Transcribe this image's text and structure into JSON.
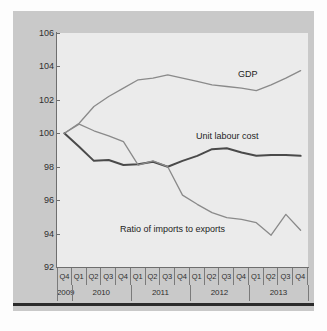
{
  "figure": {
    "background_color": "#c9c9c9",
    "plot_background_color": "#ebebeb",
    "rule_color": "#2b2b2b"
  },
  "chart_data": {
    "type": "line",
    "title": "",
    "subtitle": "",
    "xlabel": "",
    "ylabel": "",
    "ylim": [
      92,
      106
    ],
    "ytick_labels": [
      "106",
      "104",
      "102",
      "100",
      "98",
      "96",
      "94",
      "92"
    ],
    "ytick_values": [
      106,
      104,
      102,
      100,
      98,
      96,
      94,
      92
    ],
    "grid": false,
    "legend_position": "inline-annotations",
    "x": [
      "2009 Q4",
      "2010 Q1",
      "2010 Q2",
      "2010 Q3",
      "2010 Q4",
      "2011 Q1",
      "2011 Q2",
      "2011 Q3",
      "2011 Q4",
      "2012 Q1",
      "2012 Q2",
      "2012 Q3",
      "2012 Q4",
      "2013 Q1",
      "2013 Q2",
      "2013 Q3",
      "2013 Q4"
    ],
    "quarter_labels": [
      "Q4",
      "Q1",
      "Q2",
      "Q3",
      "Q4",
      "Q1",
      "Q2",
      "Q3",
      "Q4",
      "Q1",
      "Q2",
      "Q3",
      "Q4",
      "Q1",
      "Q2",
      "Q3",
      "Q4"
    ],
    "year_groups": [
      {
        "label": "2009",
        "span": 1
      },
      {
        "label": "2010",
        "span": 4
      },
      {
        "label": "2011",
        "span": 4
      },
      {
        "label": "2012",
        "span": 4
      },
      {
        "label": "2013",
        "span": 4
      }
    ],
    "series": [
      {
        "name": "GDP",
        "color": "#8a8a8a",
        "width": 1.3,
        "values": [
          100.0,
          100.6,
          101.6,
          102.2,
          102.7,
          103.2,
          103.3,
          103.5,
          103.3,
          103.1,
          102.9,
          102.8,
          102.7,
          102.55,
          102.9,
          103.3,
          103.75
        ]
      },
      {
        "name": "Unit labour cost",
        "color": "#4a4a4a",
        "width": 2.0,
        "values": [
          100.0,
          99.2,
          98.35,
          98.4,
          98.1,
          98.15,
          98.3,
          98.0,
          98.35,
          98.65,
          99.05,
          99.1,
          98.85,
          98.65,
          98.7,
          98.7,
          98.65
        ]
      },
      {
        "name": "Ratio of imports to exports",
        "color": "#8a8a8a",
        "width": 1.3,
        "values": [
          100.0,
          100.55,
          100.15,
          99.85,
          99.5,
          98.1,
          98.35,
          98.0,
          96.3,
          95.75,
          95.25,
          94.95,
          94.85,
          94.65,
          93.9,
          95.15,
          94.2
        ]
      }
    ],
    "annotations": [
      {
        "name": "gdp-label",
        "text": "GDP"
      },
      {
        "name": "unit-labour-cost-label",
        "text": "Unit labour cost"
      },
      {
        "name": "ratio-label",
        "text": "Ratio of imports to exports"
      }
    ]
  }
}
